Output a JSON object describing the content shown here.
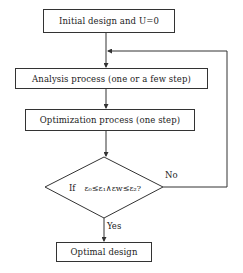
{
  "flowchart": {
    "nodes": {
      "start": {
        "label": "Initial design and U=0",
        "type": "process"
      },
      "analysis": {
        "label": "Analysis process (one or a few step)",
        "type": "process"
      },
      "optimization": {
        "label": "Optimization process (one step)",
        "type": "process"
      },
      "decision": {
        "label_prefix": "If",
        "label": "ε₀≤ε₁∧εw≤ε₂?",
        "type": "decision"
      },
      "end": {
        "label": "Optimal design",
        "type": "process"
      }
    },
    "edges": {
      "no_label": "No",
      "yes_label": "Yes"
    },
    "colors": {
      "stroke": "#333333",
      "text": "#222222",
      "background": "#ffffff"
    }
  }
}
